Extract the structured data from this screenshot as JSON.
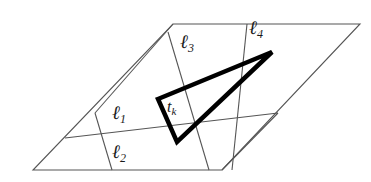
{
  "figure": {
    "type": "line-diagram",
    "background_color": "#ffffff",
    "thin_line_color": "#555555",
    "thick_line_color": "#000000",
    "thin_line_width": 1,
    "thick_line_width": 4.5,
    "canvas": {
      "width": 371,
      "height": 182
    },
    "parallelogram": {
      "name": "outer-parallelogram",
      "points": "173,24 360,24 222,170 33,170"
    },
    "lines": [
      {
        "id": "l1",
        "label": "ℓ",
        "subscript": "1",
        "x1": 65,
        "y1": 138,
        "x2": 278,
        "y2": 113,
        "label_x": 112,
        "label_y": 103
      },
      {
        "id": "l2",
        "label": "ℓ",
        "subscript": "2",
        "x1": 95,
        "y1": 113,
        "x2": 112,
        "y2": 170,
        "label_x": 112,
        "label_y": 142
      },
      {
        "id": "l3",
        "label": "ℓ",
        "subscript": "3",
        "x1": 168,
        "y1": 32,
        "x2": 209,
        "y2": 170,
        "label_x": 180,
        "label_y": 32
      },
      {
        "id": "l4",
        "label": "ℓ",
        "subscript": "4",
        "x1": 247,
        "y1": 24,
        "x2": 232,
        "y2": 170,
        "label_x": 249,
        "label_y": 18
      },
      {
        "id": "extra-left-edge",
        "x1": 95,
        "y1": 113,
        "x2": 173,
        "y2": 24
      },
      {
        "id": "extra-lower-right",
        "x1": 222,
        "y1": 170,
        "x2": 278,
        "y2": 113
      }
    ],
    "triangle": {
      "id": "tk",
      "label": "t",
      "subscript": "k",
      "points": "158,99 272,52 177,142",
      "label_x": 167,
      "label_y": 99
    }
  }
}
